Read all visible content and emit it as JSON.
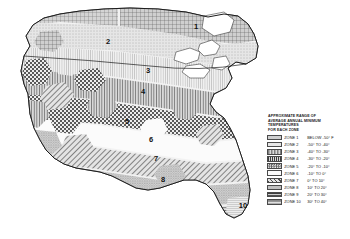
{
  "map": {
    "title": "Plant Hardiness Zone Map",
    "zone_labels": [
      {
        "n": "1",
        "x": 196,
        "y": 29
      },
      {
        "n": "2",
        "x": 108,
        "y": 44
      },
      {
        "n": "3",
        "x": 148,
        "y": 73
      },
      {
        "n": "4",
        "x": 143,
        "y": 94
      },
      {
        "n": "5",
        "x": 127,
        "y": 124
      },
      {
        "n": "6",
        "x": 151,
        "y": 142
      },
      {
        "n": "7",
        "x": 156,
        "y": 161
      },
      {
        "n": "8",
        "x": 163,
        "y": 182
      },
      {
        "n": "10",
        "x": 243,
        "y": 208
      }
    ]
  },
  "legend": {
    "title_lines": [
      "APPROXIMATE RANGE OF",
      "AVERAGE ANNUAL MINIMUM",
      "TEMPERATURES",
      "FOR EACH ZONE"
    ],
    "rows": [
      {
        "zone": "ZONE 1",
        "range": "BELOW  -50° F",
        "pattern": "grid"
      },
      {
        "zone": "ZONE 2",
        "range": "-50°  TO  -40°",
        "pattern": "stipple-light"
      },
      {
        "zone": "ZONE 3",
        "range": "-40°  TO  -30°",
        "pattern": "vert-fine"
      },
      {
        "zone": "ZONE 4",
        "range": "-30°  TO  -20°",
        "pattern": "vert-bold"
      },
      {
        "zone": "ZONE 5",
        "range": "-20°  TO  -10°",
        "pattern": "checker"
      },
      {
        "zone": "ZONE 6",
        "range": "-10°  TO   0°",
        "pattern": "blank"
      },
      {
        "zone": "ZONE 7",
        "range": "0°  TO   10°",
        "pattern": "diag"
      },
      {
        "zone": "ZONE 8",
        "range": "10°  TO   20°",
        "pattern": "stipple-dense"
      },
      {
        "zone": "ZONE 9",
        "range": "20°  TO   30°",
        "pattern": "horiz-bold"
      },
      {
        "zone": "ZONE 10",
        "range": "30°  TO   40°",
        "pattern": "horiz-fine"
      }
    ]
  }
}
